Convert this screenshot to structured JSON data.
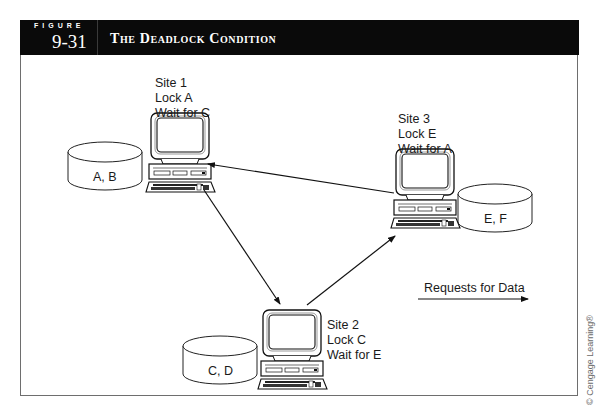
{
  "header": {
    "figure_word": "FIGURE",
    "figure_number": "9-31",
    "title": "The Deadlock Condition",
    "background_color": "#0a0a0a",
    "text_color": "#ffffff"
  },
  "sites": [
    {
      "name": "Site 1",
      "lock": "Lock A",
      "wait": "Wait for C"
    },
    {
      "name": "Site 2",
      "lock": "Lock C",
      "wait": "Wait for E"
    },
    {
      "name": "Site 3",
      "lock": "Lock E",
      "wait": "Wait for A"
    }
  ],
  "databases": [
    {
      "label": "A, B",
      "site": "Site 1"
    },
    {
      "label": "C, D",
      "site": "Site 2"
    },
    {
      "label": "E, F",
      "site": "Site 3"
    }
  ],
  "requests": [
    {
      "from": "Site 3",
      "to": "Site 1"
    },
    {
      "from": "Site 1",
      "to": "Site 2"
    },
    {
      "from": "Site 2",
      "to": "Site 3"
    }
  ],
  "legend": {
    "label": "Requests for Data",
    "icon": "arrow-right-icon"
  },
  "copyright": "© Cengage Learning®"
}
